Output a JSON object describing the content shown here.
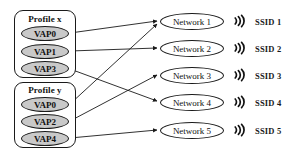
{
  "diagram": {
    "profiles": [
      {
        "id": "profile-x",
        "label": "Profile x",
        "box": {
          "x": 14,
          "y": 10,
          "w": 62,
          "h": 68
        },
        "title_y": 14,
        "vaps": [
          {
            "id": "x-vap0",
            "label": "VAP0",
            "x": 21,
            "y": 26
          },
          {
            "id": "x-vap1",
            "label": "VAP1",
            "x": 21,
            "y": 44
          },
          {
            "id": "x-vap3",
            "label": "VAP3",
            "x": 21,
            "y": 61
          }
        ]
      },
      {
        "id": "profile-y",
        "label": "Profile y",
        "box": {
          "x": 14,
          "y": 82,
          "w": 62,
          "h": 66
        },
        "title_y": 85,
        "vaps": [
          {
            "id": "y-vap0",
            "label": "VAP0",
            "x": 21,
            "y": 97
          },
          {
            "id": "y-vap2",
            "label": "VAP2",
            "x": 21,
            "y": 114
          },
          {
            "id": "y-vap4",
            "label": "VAP4",
            "x": 21,
            "y": 131
          }
        ]
      }
    ],
    "networks": [
      {
        "id": "network-1",
        "label": "Network 1",
        "x": 160,
        "y": 13,
        "wifi_x": 231,
        "wifi_y": 13,
        "ssid": "SSID 1",
        "ssid_x": 255,
        "ssid_y": 17
      },
      {
        "id": "network-2",
        "label": "Network 2",
        "x": 160,
        "y": 40,
        "wifi_x": 231,
        "wifi_y": 40,
        "ssid": "SSID 2",
        "ssid_x": 255,
        "ssid_y": 44
      },
      {
        "id": "network-3",
        "label": "Network 3",
        "x": 160,
        "y": 67,
        "wifi_x": 231,
        "wifi_y": 67,
        "ssid": "SSID 3",
        "ssid_x": 255,
        "ssid_y": 71
      },
      {
        "id": "network-4",
        "label": "Network 4",
        "x": 160,
        "y": 94,
        "wifi_x": 231,
        "wifi_y": 94,
        "ssid": "SSID 4",
        "ssid_x": 255,
        "ssid_y": 98
      },
      {
        "id": "network-5",
        "label": "Network 5",
        "x": 160,
        "y": 122,
        "wifi_x": 231,
        "wifi_y": 122,
        "ssid": "SSID 5",
        "ssid_x": 255,
        "ssid_y": 126
      }
    ],
    "connections": [
      {
        "id": "edge-x-vap0-network-1",
        "from": "x-vap0",
        "to": "network-1",
        "x1": 70,
        "y1": 33,
        "x2": 157,
        "y2": 21
      },
      {
        "id": "edge-x-vap1-network-2",
        "from": "x-vap1",
        "to": "network-2",
        "x1": 70,
        "y1": 51,
        "x2": 157,
        "y2": 48
      },
      {
        "id": "edge-x-vap3-network-4",
        "from": "x-vap3",
        "to": "network-4",
        "x1": 70,
        "y1": 69,
        "x2": 157,
        "y2": 101
      },
      {
        "id": "edge-y-vap0-network-1",
        "from": "y-vap0",
        "to": "network-1",
        "x1": 70,
        "y1": 104,
        "x2": 157,
        "y2": 24
      },
      {
        "id": "edge-y-vap2-network-3",
        "from": "y-vap2",
        "to": "network-3",
        "x1": 70,
        "y1": 121,
        "x2": 157,
        "y2": 75
      },
      {
        "id": "edge-y-vap4-network-5",
        "from": "y-vap4",
        "to": "network-5",
        "x1": 70,
        "y1": 138,
        "x2": 157,
        "y2": 130
      }
    ],
    "colors": {
      "stroke": "#1a1a1a",
      "vap_fill": "#c9c9c9",
      "network_fill": "#ffffff",
      "background": "#ffffff"
    },
    "icons": {
      "wifi": "wifi-arcs-icon"
    }
  }
}
